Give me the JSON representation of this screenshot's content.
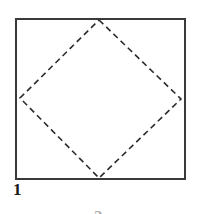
{
  "figure": {
    "caption_label": "1",
    "partial_next_label": "2",
    "background_color": "#ffffff",
    "outline_color": "#3a3a3a",
    "dash_color": "#2b2b2b",
    "label_color": "#1a1a1a",
    "square": {
      "name": "outer-square",
      "stroke_style": "solid",
      "stroke_width": 1.4,
      "left": 16,
      "top": 19,
      "right": 185,
      "bottom": 179,
      "width": 169,
      "height": 160
    },
    "diamond": {
      "name": "inscribed-dashed-diamond",
      "stroke_style": "dashed",
      "stroke_width": 1.6,
      "dash_length": 6,
      "dash_gap": 4,
      "vertices": [
        {
          "name": "top",
          "x": 99,
          "y": 20
        },
        {
          "name": "right",
          "x": 181,
          "y": 99
        },
        {
          "name": "bottom",
          "x": 99,
          "y": 178
        },
        {
          "name": "left",
          "x": 20,
          "y": 98
        }
      ]
    }
  }
}
